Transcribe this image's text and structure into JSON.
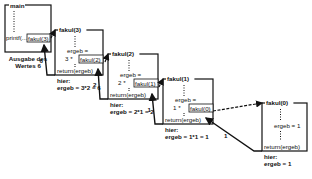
{
  "main": {
    "title": "main",
    "call_prefix": "printf(...",
    "call_label": "fakul(3)",
    "caption_line1": "Ausgabe des",
    "caption_line2": "Wertes 6"
  },
  "frames": [
    {
      "title": "fakul(3)",
      "ergeb_label": "ergeb =",
      "mult": "3 *",
      "call": "fakul(2)",
      "ret": "return(ergeb)",
      "return_value": "6",
      "note_label": "hier:",
      "note": "ergeb = 3*2 = 6"
    },
    {
      "title": "fakul(2)",
      "ergeb_label": "ergeb =",
      "mult": "2 *",
      "call": "fakul(1)",
      "ret": "return(ergeb)",
      "return_value": "2",
      "note_label": "hier:",
      "note": "ergeb = 2*1 = 2"
    },
    {
      "title": "fakul(1)",
      "ergeb_label": "ergeb =",
      "mult": "1 *",
      "call": "fakul(0)",
      "ret": "return(ergeb)",
      "return_value": "1",
      "note_label": "hier:",
      "note": "ergeb = 1*1 = 1"
    },
    {
      "title": "fakul(0)",
      "ergeb_label": "ergeb = 1",
      "ret": "return(ergeb)",
      "return_value": "1",
      "note_label": "hier:",
      "note": "ergeb = 1"
    }
  ]
}
